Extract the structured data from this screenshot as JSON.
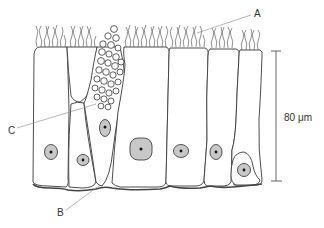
{
  "figure": {
    "type": "labelled histology diagram",
    "colors": {
      "outline": "#3a3a3a",
      "nucleus_fill": "#c8c8c8",
      "nucleolus": "#111111",
      "leader_line": "#8a8a8a",
      "background": "#ffffff"
    }
  },
  "labels": {
    "a": "A",
    "b": "B",
    "c": "C"
  },
  "scale_bar": {
    "label": "80 μm",
    "value": 80,
    "unit": "μm"
  }
}
